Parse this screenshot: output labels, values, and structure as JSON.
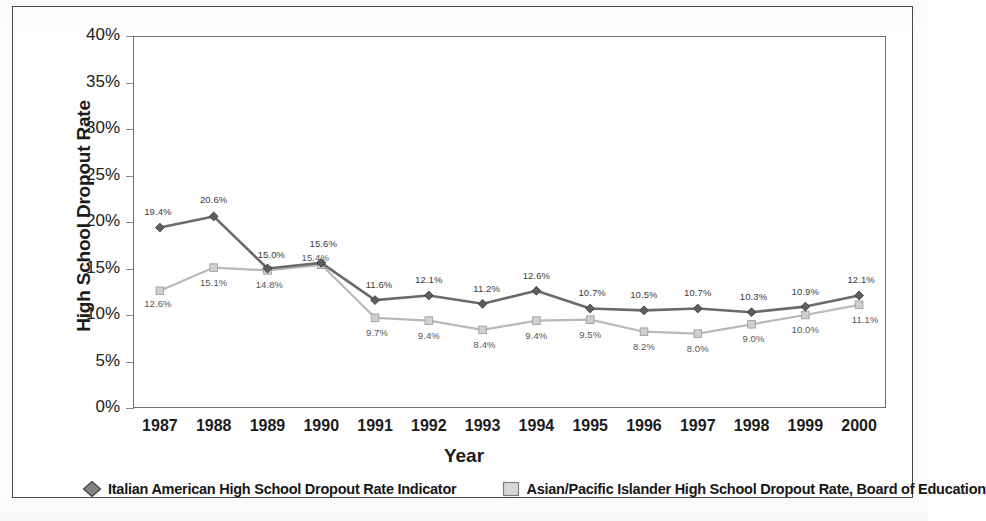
{
  "chart_data": {
    "type": "line",
    "title": "",
    "xlabel": "Year",
    "ylabel": "High School Dropout Rate",
    "categories": [
      "1987",
      "1988",
      "1989",
      "1990",
      "1991",
      "1992",
      "1993",
      "1994",
      "1995",
      "1996",
      "1997",
      "1998",
      "1999",
      "2000"
    ],
    "ylim": [
      0,
      40
    ],
    "ytick_labels": [
      "40%",
      "35%",
      "30%",
      "25%",
      "20%",
      "15%",
      "10%",
      "5%",
      "0%"
    ],
    "ytick_values": [
      40,
      35,
      30,
      25,
      20,
      15,
      10,
      5,
      0
    ],
    "grid": false,
    "legend_position": "bottom",
    "series": [
      {
        "name": "Italian American High School Dropout Rate Indicator",
        "marker": "diamond",
        "color": "#6b6b6b",
        "values": [
          19.4,
          20.6,
          15.0,
          15.6,
          11.6,
          12.1,
          11.2,
          12.6,
          10.7,
          10.5,
          10.7,
          10.3,
          10.9,
          12.1
        ],
        "labels": [
          "19.4%",
          "20.6%",
          "15.0%",
          "15.6%",
          "11.6%",
          "12.1%",
          "11.2%",
          "12.6%",
          "10.7%",
          "10.5%",
          "10.7%",
          "10.3%",
          "10.9%",
          "12.1%"
        ]
      },
      {
        "name": "Asian/Pacific Islander High School Dropout Rate, Board of Education",
        "marker": "square",
        "color": "#b9b9b9",
        "values": [
          12.6,
          15.1,
          14.8,
          15.4,
          9.7,
          9.4,
          8.4,
          9.4,
          9.5,
          8.2,
          8.0,
          9.0,
          10.0,
          11.1
        ],
        "labels": [
          "12.6%",
          "15.1%",
          "14.8%",
          "15.4%",
          "9.7%",
          "9.4%",
          "8.4%",
          "9.4%",
          "9.5%",
          "8.2%",
          "8.0%",
          "9.0%",
          "10.0%",
          "11.1%"
        ]
      }
    ]
  },
  "axis": {
    "y_title": "High School Dropout Rate",
    "x_title": "Year"
  },
  "legend": {
    "items": [
      {
        "label": "Italian American High School Dropout Rate Indicator",
        "marker": "diamond",
        "color": "#6e6e6e"
      },
      {
        "label": "Asian/Pacific Islander High School Dropout Rate, Board of Education",
        "marker": "square",
        "color": "#c9c9c9"
      }
    ]
  }
}
